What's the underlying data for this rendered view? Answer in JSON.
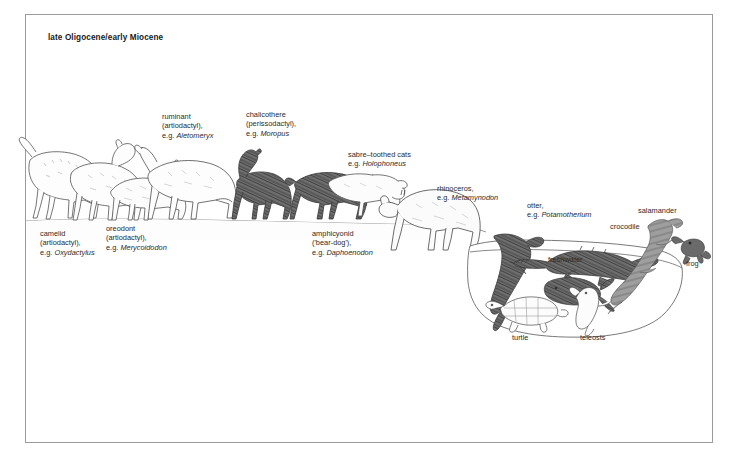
{
  "figure": {
    "title": "late Oligocene/early Miocene",
    "scene_type": "paleoenvironment reconstruction",
    "border_color": "#9a9a9a",
    "background_color": "#ffffff"
  },
  "labels": [
    {
      "id": "camelid",
      "name": "camelid",
      "lines": [
        "camelid",
        "(artiodactyl),",
        "e.g. Oxydactylus"
      ],
      "genus": "Oxydactylus",
      "x": 40,
      "y": 229
    },
    {
      "id": "oreodont",
      "name": "oreodont",
      "lines": [
        "oreodont",
        "(artiodactyl),",
        "e.g. Merycoidodon"
      ],
      "genus": "Merycoidodon",
      "x": 106,
      "y": 224
    },
    {
      "id": "ruminant",
      "name": "ruminant",
      "lines": [
        "ruminant",
        "(artiodactyl),",
        "e.g. Aletomeryx"
      ],
      "genus": "Aletomeryx",
      "x": 162,
      "y": 112
    },
    {
      "id": "chalicothere",
      "name": "chalicothere",
      "lines": [
        "chalicothere",
        "(perissodactyl),",
        "e.g. Moropus"
      ],
      "genus": "Moropus",
      "x": 246,
      "y": 110
    },
    {
      "id": "sabre-toothed-cats",
      "name": "sabre-toothed cats",
      "lines": [
        "sabre–toothed cats",
        "e.g. Holophoneus"
      ],
      "genus": "Holophoneus",
      "x": 348,
      "y": 150
    },
    {
      "id": "amphicyonid",
      "name": "amphicyonid",
      "lines": [
        "amphicyonid",
        "('bear-dog'),",
        "e.g. Daphoenodon"
      ],
      "genus": "Daphoenodon",
      "x": 312,
      "y": 229
    },
    {
      "id": "rhinoceros",
      "name": "rhinoceros",
      "lines": [
        "rhinoceros,",
        "e.g. Metamynodon"
      ],
      "genus": "Metamynodon",
      "x": 437,
      "y": 184
    },
    {
      "id": "otter",
      "name": "otter",
      "lines": [
        "otter,",
        "e.g. Potamotherium"
      ],
      "genus": "Potamotherium",
      "x": 527,
      "y": 201
    },
    {
      "id": "crocodile",
      "name": "crocodile",
      "lines": [
        "crocodile"
      ],
      "genus": "",
      "x": 610,
      "y": 222
    },
    {
      "id": "salamander",
      "name": "salamander",
      "lines": [
        "salamander"
      ],
      "genus": "",
      "x": 638,
      "y": 206
    },
    {
      "id": "frog",
      "name": "frog",
      "lines": [
        "frog"
      ],
      "genus": "",
      "x": 686,
      "y": 259
    },
    {
      "id": "freshwater",
      "name": "freshwater",
      "lines": [
        "freshwater"
      ],
      "genus": "",
      "x": 548,
      "y": 255
    },
    {
      "id": "turtle",
      "name": "turtle",
      "lines": [
        "turtle"
      ],
      "genus": "",
      "x": 512,
      "y": 333
    },
    {
      "id": "teleosts",
      "name": "teleosts",
      "lines": [
        "teleosts"
      ],
      "genus": "",
      "x": 580,
      "y": 333
    }
  ],
  "organisms": [
    {
      "id": "camelid",
      "common_name": "camelid",
      "group": "artiodactyl",
      "genus": "Oxydactylus",
      "tone": "outline"
    },
    {
      "id": "oreodont",
      "common_name": "oreodont",
      "group": "artiodactyl",
      "genus": "Merycoidodon",
      "tone": "outline"
    },
    {
      "id": "ruminant",
      "common_name": "ruminant",
      "group": "artiodactyl",
      "genus": "Aletomeryx",
      "tone": "outline"
    },
    {
      "id": "chalicothere",
      "common_name": "chalicothere",
      "group": "perissodactyl",
      "genus": "Moropus",
      "tone": "dark"
    },
    {
      "id": "amphicyonid",
      "common_name": "amphicyonid ('bear-dog')",
      "group": "carnivore",
      "genus": "Daphoenodon",
      "tone": "dark"
    },
    {
      "id": "sabre-toothed-cat",
      "common_name": "sabre-toothed cat",
      "group": "carnivore",
      "genus": "Holophoneus",
      "tone": "outline"
    },
    {
      "id": "rhinoceros",
      "common_name": "rhinoceros",
      "group": "perissodactyl",
      "genus": "Metamynodon",
      "tone": "outline"
    },
    {
      "id": "otter",
      "common_name": "otter",
      "group": "carnivore",
      "genus": "Potamotherium",
      "tone": "dark"
    },
    {
      "id": "crocodile",
      "common_name": "crocodile",
      "group": "reptile",
      "genus": "",
      "tone": "dark"
    },
    {
      "id": "salamander",
      "common_name": "salamander",
      "group": "amphibian",
      "genus": "",
      "tone": "mid"
    },
    {
      "id": "frog",
      "common_name": "frog",
      "group": "amphibian",
      "genus": "",
      "tone": "dark"
    },
    {
      "id": "turtle",
      "common_name": "turtle",
      "group": "reptile",
      "genus": "",
      "tone": "outline"
    },
    {
      "id": "teleost-upper",
      "common_name": "teleost",
      "group": "fish",
      "genus": "",
      "tone": "dark"
    },
    {
      "id": "teleost-lower",
      "common_name": "teleost",
      "group": "fish",
      "genus": "",
      "tone": "outline"
    }
  ],
  "colors": {
    "ink": "#2b2b2b",
    "dark_fill": "#6d6d6d",
    "mid_fill": "#9c9c9c",
    "light_fill": "#fbfbfb",
    "ground": "#7d7d7d",
    "water_outline": "#6a6a6a"
  }
}
